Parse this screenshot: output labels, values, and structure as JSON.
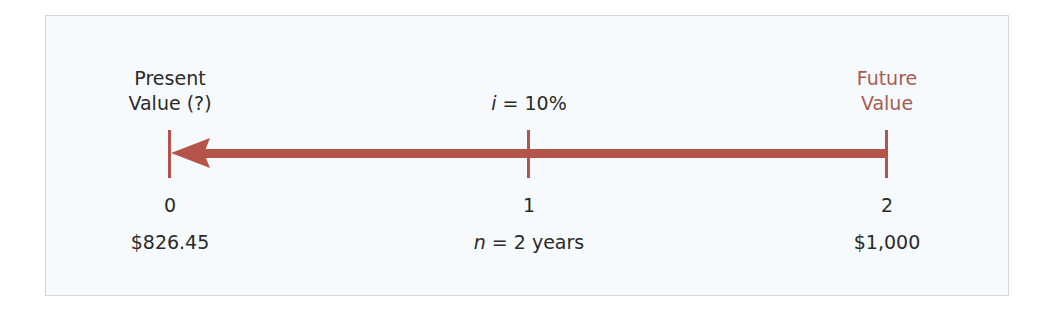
{
  "diagram": {
    "type": "timeline",
    "arrow_direction": "left",
    "colors": {
      "arrow": "#b5544a",
      "future_label": "#a85a52",
      "text": "#2a2a2a",
      "frame_border": "#cfd8de",
      "frame_bg": "#f7fafc"
    },
    "left_label": {
      "line1": "Present",
      "line2": "Value (?)"
    },
    "right_label": {
      "line1": "Future",
      "line2": "Value"
    },
    "rate": {
      "var": "i",
      "eq": " = 10%"
    },
    "periods": [
      {
        "tick": "0",
        "value": "$826.45"
      },
      {
        "tick": "1",
        "value_var": "n",
        "value": " = 2 years"
      },
      {
        "tick": "2",
        "value": "$1,000"
      }
    ]
  }
}
